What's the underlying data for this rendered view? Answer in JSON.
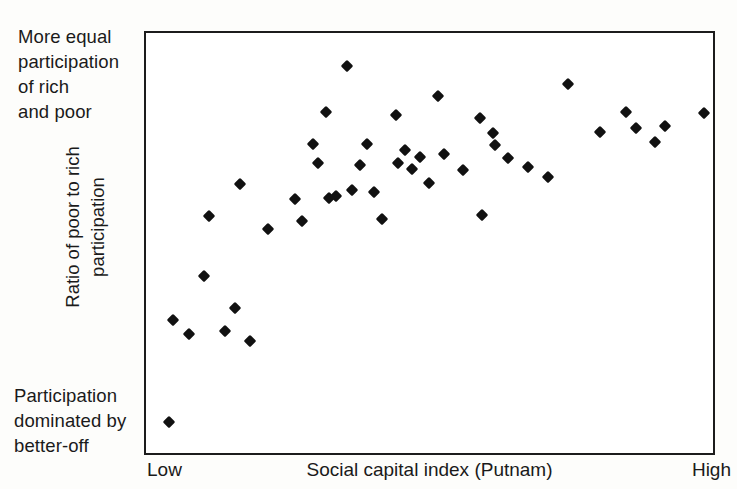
{
  "chart_data": {
    "type": "scatter",
    "title": "",
    "xlabel": "Social capital index (Putnam)",
    "ylabel": "Ratio of poor to rich participation",
    "xlim": [
      0,
      100
    ],
    "ylim": [
      0,
      100
    ],
    "grid": false,
    "legend": null,
    "x_tick_labels": [
      "Low",
      "High"
    ],
    "y_axis_top_note": "More equal participation of rich and poor",
    "y_axis_bottom_note": "Participation dominated by better-off",
    "marker": "diamond",
    "marker_color": "#111111",
    "n_points": 46,
    "x": [
      4.1,
      6.6,
      8.4,
      11.0,
      11.2,
      13.8,
      14.0,
      16.6,
      18.8,
      21.9,
      26.3,
      27.3,
      29.2,
      30.0,
      31.7,
      32.0,
      33.3,
      35.2,
      36.3,
      36.6,
      37.0,
      38.5,
      39.4,
      41.8,
      42.2,
      43.8,
      45.0,
      46.6,
      47.5,
      50.0,
      51.0,
      54.3,
      55.3,
      56.5,
      58.5,
      59.9,
      61.0,
      63.4,
      65.7,
      68.7,
      74.0,
      79.5,
      84.0,
      85.8,
      87.5,
      97.7
    ],
    "y": [
      6.3,
      70.3,
      67.0,
      76.7,
      56.4,
      69.6,
      84.2,
      59.2,
      54.6,
      71.9,
      78.9,
      74.8,
      85.0,
      82.3,
      76.7,
      71.2,
      71.5,
      97.5,
      67.2,
      74.0,
      82.5,
      74.1,
      67.2,
      80.2,
      75.5,
      78.5,
      75.4,
      79.0,
      73.1,
      86.9,
      78.0,
      71.6,
      88.4,
      67.1,
      84.1,
      81.2,
      78.6,
      76.7,
      75.4,
      93.6,
      81.8,
      85.6,
      84.3,
      80.6,
      84.6,
      84.5
    ],
    "points_px": [
      [
        167,
        420
      ],
      [
        171,
        318
      ],
      [
        187,
        332
      ],
      [
        202,
        274
      ],
      [
        207,
        214
      ],
      [
        223,
        329
      ],
      [
        238,
        182
      ],
      [
        233,
        306
      ],
      [
        248,
        339
      ],
      [
        266,
        227
      ],
      [
        293,
        197
      ],
      [
        300,
        219
      ],
      [
        311,
        142
      ],
      [
        316,
        161
      ],
      [
        324,
        110
      ],
      [
        327,
        196
      ],
      [
        334,
        194
      ],
      [
        345,
        64
      ],
      [
        350,
        188
      ],
      [
        358,
        163
      ],
      [
        365,
        142
      ],
      [
        372,
        190
      ],
      [
        380,
        217
      ],
      [
        394,
        113
      ],
      [
        396,
        161
      ],
      [
        403,
        148
      ],
      [
        410,
        167
      ],
      [
        418,
        155
      ],
      [
        427,
        181
      ],
      [
        436,
        94
      ],
      [
        442,
        152
      ],
      [
        461,
        168
      ],
      [
        478,
        116
      ],
      [
        480,
        213
      ],
      [
        491,
        131
      ],
      [
        493,
        143
      ],
      [
        506,
        156
      ],
      [
        526,
        165
      ],
      [
        546,
        175
      ],
      [
        566,
        82
      ],
      [
        598,
        130
      ],
      [
        624,
        110
      ],
      [
        634,
        126
      ],
      [
        653,
        140
      ],
      [
        663,
        124
      ],
      [
        702,
        111
      ]
    ]
  },
  "labels": {
    "top_left_note": "More equal\nparticipation\nof rich\nand poor",
    "bottom_left_note": "Participation\ndominated by\nbetter-off",
    "y_axis_label": "Ratio of poor to rich\nparticipation",
    "x_low": "Low",
    "x_title": "Social capital index (Putnam)",
    "x_high": "High"
  }
}
